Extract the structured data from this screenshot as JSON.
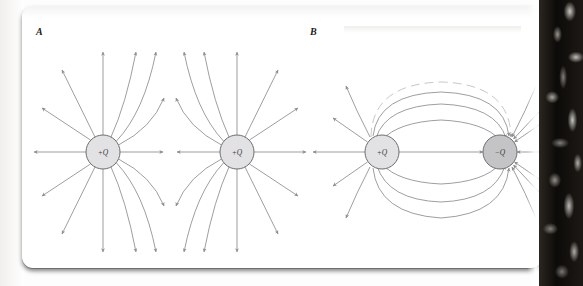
{
  "figure": {
    "kind": "electric-field-lines-diagram",
    "panels": [
      {
        "id": "A",
        "label": "A",
        "caption_label": "A",
        "description": "Electric field lines of two equal positive point charges",
        "charges": [
          {
            "label": "+Q",
            "sign": "positive",
            "cx": 103,
            "cy": 152,
            "r": 17,
            "fill": "#e2e2e4"
          },
          {
            "label": "+Q",
            "sign": "positive",
            "cx": 237,
            "cy": 152,
            "r": 17,
            "fill": "#e2e2e4"
          }
        ],
        "neutral_point": {
          "x": 170,
          "y": 152
        }
      },
      {
        "id": "B",
        "label": "B",
        "caption_label": "B",
        "description": "Electric field lines of an electric dipole: one positive and one negative charge",
        "charges": [
          {
            "label": "+Q",
            "sign": "positive",
            "cx": 382,
            "cy": 152,
            "r": 17,
            "fill": "#e2e2e4"
          },
          {
            "label": "−Q",
            "sign": "negative",
            "cx": 500,
            "cy": 152,
            "r": 17,
            "fill": "#c4c4c7"
          }
        ],
        "loop_count_above": 4,
        "loop_count_below": 3
      }
    ],
    "colors": {
      "field_line": "#8d8d90",
      "faint_field_line": "#b9b9bc",
      "charge_outline": "#6e6e72",
      "positive_fill": "#e2e2e4",
      "negative_fill": "#c4c4c7",
      "page": "#ffffff",
      "scan_edge": "#151310"
    }
  }
}
